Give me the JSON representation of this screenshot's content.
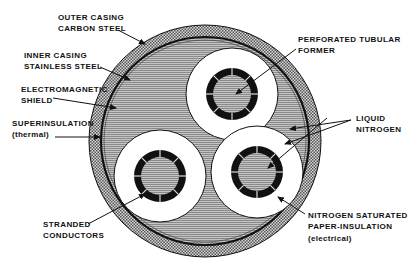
{
  "diagram": {
    "type": "cross-section",
    "labels": {
      "outer_casing": [
        "OUTER CASING",
        "CARBON STEEL"
      ],
      "inner_casing": [
        "INNER CASING",
        "STAINLESS STEEL"
      ],
      "em_shield": [
        "ELECTROMAGNETIC",
        "SHIELD"
      ],
      "superinsulation": [
        "SUPERINSULATION",
        "(thermal)"
      ],
      "tubular_former": [
        "PERFORATED TUBULAR",
        "FORMER"
      ],
      "liquid_nitrogen": [
        "LIQUID",
        "NITROGEN"
      ],
      "stranded_conductors": [
        "STRANDED",
        "CONDUCTORS"
      ],
      "paper_insulation": [
        "NITROGEN SATURATED",
        "PAPER-INSULATION",
        "(electrical)"
      ]
    },
    "colors": {
      "line": "#111111",
      "hatch_gray": "#9a9a9a",
      "stipple_gray": "#8c8c8c",
      "background": "#ffffff"
    }
  }
}
